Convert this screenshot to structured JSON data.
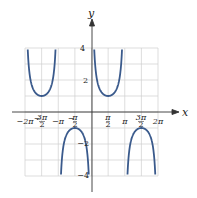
{
  "chart_data": {
    "type": "line",
    "title": "",
    "function": "y = csc x",
    "xlabel": "x",
    "ylabel": "y",
    "xlim": [
      -6.2832,
      6.2832
    ],
    "ylim": [
      -4,
      4
    ],
    "grid": true,
    "x_tick_labels": [
      "-2π",
      "-3π/2",
      "-π",
      "-π/2",
      "π/2",
      "π",
      "3π/2",
      "2π"
    ],
    "y_tick_labels": [
      "4",
      "2",
      "-2",
      "-4"
    ],
    "asymptotes": [
      "-2π",
      "-π",
      "0",
      "π",
      "2π"
    ],
    "series": [
      {
        "name": "csc x",
        "color": "#3a5a8c",
        "branches": [
          {
            "domain": [
              "-2π",
              "-π"
            ],
            "vertex": {
              "x": "-3π/2",
              "y": 1
            }
          },
          {
            "domain": [
              "-π",
              "0"
            ],
            "vertex": {
              "x": "-π/2",
              "y": -1
            }
          },
          {
            "domain": [
              "0",
              "π"
            ],
            "vertex": {
              "x": "π/2",
              "y": 1
            }
          },
          {
            "domain": [
              "π",
              "2π"
            ],
            "vertex": {
              "x": "3π/2",
              "y": -1
            }
          }
        ]
      }
    ]
  },
  "labels": {
    "x_axis": "x",
    "y_axis": "y",
    "xt": {
      "m2pi": "−2π",
      "m3pi2_num": "3π",
      "m3pi2_den": "2",
      "mpi": "−π",
      "mpi2_num": "π",
      "mpi2_den": "2",
      "pi2_num": "π",
      "pi2_den": "2",
      "pi": "π",
      "p3pi2_num": "3π",
      "p3pi2_den": "2",
      "p2pi": "2π"
    },
    "yt": {
      "p4": "4",
      "p2": "2",
      "m2": "−2",
      "m4": "−4"
    }
  }
}
